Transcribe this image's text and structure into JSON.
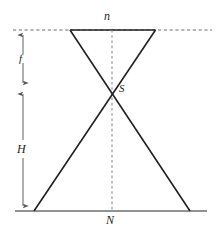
{
  "figure": {
    "name": "optical-conjugate-planes-diagram",
    "width": 219,
    "height": 233,
    "background_color": "#ffffff",
    "stroke_color": "#231f20",
    "dimension_color": "#58595b",
    "labels": {
      "top_plane": "n",
      "bottom_plane": "N",
      "crossing_point": "S",
      "upper_distance": "f",
      "lower_distance": "H"
    },
    "geometry": {
      "top_dashed_line": {
        "y": 30,
        "x1": 13,
        "x2": 212,
        "style": "dashed"
      },
      "top_solid_line": {
        "y": 30,
        "x1": 70,
        "x2": 155,
        "style": "solid"
      },
      "bottom_solid_line": {
        "y": 211,
        "x1": 15,
        "x2": 207,
        "style": "solid"
      },
      "center_dashed_line": {
        "x": 112,
        "y1": 30,
        "y2": 211,
        "style": "dashed"
      },
      "diagonal_left_to_right": {
        "x1": 70,
        "y1": 30,
        "x2": 190,
        "y2": 211
      },
      "diagonal_right_to_left": {
        "x1": 155,
        "y1": 30,
        "x2": 34,
        "y2": 211
      },
      "crossing_point": {
        "x": 112,
        "y": 89
      },
      "dimension_axis_x": 23,
      "dimension_f": {
        "y1": 30,
        "y2": 88,
        "arrows": "both"
      },
      "dimension_H": {
        "y1": 88,
        "y2": 211,
        "arrows": "both"
      }
    }
  }
}
